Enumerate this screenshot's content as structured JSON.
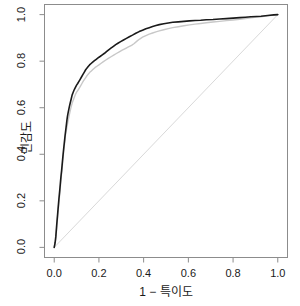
{
  "chart_data": {
    "type": "line",
    "title": "",
    "subtitle": "",
    "xlabel": "1 − 특이도",
    "ylabel": "민감도",
    "xlim": [
      0,
      1
    ],
    "ylim": [
      0,
      1
    ],
    "grid": false,
    "legend": "none",
    "xticks": [
      "0.0",
      "0.2",
      "0.4",
      "0.6",
      "0.8",
      "1.0"
    ],
    "xtick_values": [
      0.0,
      0.2,
      0.4,
      0.6,
      0.8,
      1.0
    ],
    "yticks": [
      "0.0",
      "0.2",
      "0.4",
      "0.6",
      "0.8",
      "1.0"
    ],
    "ytick_values": [
      0.0,
      0.2,
      0.4,
      0.6,
      0.8,
      1.0
    ],
    "series": [
      {
        "name": "roc-curve-black",
        "color": "#1a1a1a",
        "width": 1.6,
        "points": [
          [
            0.0,
            0.0
          ],
          [
            0.004,
            0.02
          ],
          [
            0.007,
            0.045
          ],
          [
            0.009,
            0.07
          ],
          [
            0.011,
            0.095
          ],
          [
            0.013,
            0.118
          ],
          [
            0.015,
            0.14
          ],
          [
            0.017,
            0.163
          ],
          [
            0.019,
            0.186
          ],
          [
            0.021,
            0.208
          ],
          [
            0.023,
            0.228
          ],
          [
            0.025,
            0.248
          ],
          [
            0.027,
            0.27
          ],
          [
            0.029,
            0.292
          ],
          [
            0.031,
            0.312
          ],
          [
            0.033,
            0.33
          ],
          [
            0.035,
            0.35
          ],
          [
            0.037,
            0.372
          ],
          [
            0.039,
            0.392
          ],
          [
            0.041,
            0.412
          ],
          [
            0.043,
            0.43
          ],
          [
            0.045,
            0.448
          ],
          [
            0.047,
            0.466
          ],
          [
            0.049,
            0.484
          ],
          [
            0.051,
            0.5
          ],
          [
            0.053,
            0.516
          ],
          [
            0.055,
            0.532
          ],
          [
            0.057,
            0.548
          ],
          [
            0.059,
            0.562
          ],
          [
            0.062,
            0.578
          ],
          [
            0.065,
            0.592
          ],
          [
            0.068,
            0.606
          ],
          [
            0.071,
            0.618
          ],
          [
            0.074,
            0.63
          ],
          [
            0.077,
            0.642
          ],
          [
            0.08,
            0.654
          ],
          [
            0.084,
            0.664
          ],
          [
            0.088,
            0.674
          ],
          [
            0.092,
            0.682
          ],
          [
            0.096,
            0.69
          ],
          [
            0.1,
            0.697
          ],
          [
            0.105,
            0.704
          ],
          [
            0.11,
            0.712
          ],
          [
            0.116,
            0.722
          ],
          [
            0.122,
            0.732
          ],
          [
            0.128,
            0.742
          ],
          [
            0.134,
            0.752
          ],
          [
            0.14,
            0.762
          ],
          [
            0.146,
            0.77
          ],
          [
            0.152,
            0.777
          ],
          [
            0.158,
            0.784
          ],
          [
            0.165,
            0.79
          ],
          [
            0.172,
            0.796
          ],
          [
            0.18,
            0.802
          ],
          [
            0.188,
            0.808
          ],
          [
            0.196,
            0.814
          ],
          [
            0.205,
            0.82
          ],
          [
            0.215,
            0.827
          ],
          [
            0.225,
            0.834
          ],
          [
            0.235,
            0.842
          ],
          [
            0.245,
            0.85
          ],
          [
            0.255,
            0.857
          ],
          [
            0.265,
            0.864
          ],
          [
            0.275,
            0.871
          ],
          [
            0.285,
            0.877
          ],
          [
            0.297,
            0.884
          ],
          [
            0.31,
            0.891
          ],
          [
            0.323,
            0.898
          ],
          [
            0.336,
            0.905
          ],
          [
            0.35,
            0.912
          ],
          [
            0.365,
            0.92
          ],
          [
            0.38,
            0.927
          ],
          [
            0.395,
            0.933
          ],
          [
            0.41,
            0.939
          ],
          [
            0.425,
            0.944
          ],
          [
            0.44,
            0.949
          ],
          [
            0.455,
            0.953
          ],
          [
            0.47,
            0.957
          ],
          [
            0.49,
            0.961
          ],
          [
            0.51,
            0.964
          ],
          [
            0.53,
            0.967
          ],
          [
            0.555,
            0.969
          ],
          [
            0.58,
            0.971
          ],
          [
            0.605,
            0.973
          ],
          [
            0.63,
            0.975
          ],
          [
            0.655,
            0.976
          ],
          [
            0.68,
            0.978
          ],
          [
            0.71,
            0.979
          ],
          [
            0.74,
            0.981
          ],
          [
            0.77,
            0.983
          ],
          [
            0.8,
            0.985
          ],
          [
            0.83,
            0.987
          ],
          [
            0.855,
            0.989
          ],
          [
            0.88,
            0.991
          ],
          [
            0.905,
            0.992
          ],
          [
            0.925,
            0.993
          ],
          [
            0.945,
            0.995
          ],
          [
            0.965,
            0.997
          ],
          [
            0.982,
            0.999
          ],
          [
            1.0,
            1.0
          ]
        ]
      },
      {
        "name": "roc-curve-gray",
        "color": "#c8c8c8",
        "width": 1.4,
        "points": [
          [
            0.0,
            0.0
          ],
          [
            0.005,
            0.022
          ],
          [
            0.008,
            0.046
          ],
          [
            0.01,
            0.07
          ],
          [
            0.012,
            0.094
          ],
          [
            0.014,
            0.116
          ],
          [
            0.016,
            0.138
          ],
          [
            0.018,
            0.16
          ],
          [
            0.02,
            0.182
          ],
          [
            0.022,
            0.204
          ],
          [
            0.024,
            0.224
          ],
          [
            0.026,
            0.244
          ],
          [
            0.028,
            0.266
          ],
          [
            0.03,
            0.288
          ],
          [
            0.032,
            0.308
          ],
          [
            0.034,
            0.326
          ],
          [
            0.036,
            0.346
          ],
          [
            0.038,
            0.368
          ],
          [
            0.04,
            0.388
          ],
          [
            0.042,
            0.408
          ],
          [
            0.044,
            0.426
          ],
          [
            0.046,
            0.444
          ],
          [
            0.048,
            0.462
          ],
          [
            0.05,
            0.48
          ],
          [
            0.053,
            0.496
          ],
          [
            0.056,
            0.512
          ],
          [
            0.059,
            0.528
          ],
          [
            0.062,
            0.543
          ],
          [
            0.065,
            0.557
          ],
          [
            0.068,
            0.571
          ],
          [
            0.071,
            0.584
          ],
          [
            0.074,
            0.597
          ],
          [
            0.077,
            0.608
          ],
          [
            0.08,
            0.619
          ],
          [
            0.084,
            0.63
          ],
          [
            0.088,
            0.64
          ],
          [
            0.092,
            0.65
          ],
          [
            0.096,
            0.659
          ],
          [
            0.1,
            0.667
          ],
          [
            0.106,
            0.675
          ],
          [
            0.112,
            0.684
          ],
          [
            0.118,
            0.694
          ],
          [
            0.124,
            0.704
          ],
          [
            0.13,
            0.714
          ],
          [
            0.137,
            0.724
          ],
          [
            0.144,
            0.734
          ],
          [
            0.151,
            0.743
          ],
          [
            0.158,
            0.751
          ],
          [
            0.166,
            0.758
          ],
          [
            0.174,
            0.765
          ],
          [
            0.182,
            0.772
          ],
          [
            0.191,
            0.778
          ],
          [
            0.2,
            0.784
          ],
          [
            0.21,
            0.791
          ],
          [
            0.22,
            0.798
          ],
          [
            0.231,
            0.805
          ],
          [
            0.242,
            0.812
          ],
          [
            0.254,
            0.819
          ],
          [
            0.266,
            0.826
          ],
          [
            0.278,
            0.833
          ],
          [
            0.291,
            0.84
          ],
          [
            0.304,
            0.847
          ],
          [
            0.318,
            0.854
          ],
          [
            0.332,
            0.861
          ],
          [
            0.346,
            0.868
          ],
          [
            0.358,
            0.876
          ],
          [
            0.37,
            0.886
          ],
          [
            0.382,
            0.895
          ],
          [
            0.395,
            0.903
          ],
          [
            0.41,
            0.91
          ],
          [
            0.425,
            0.916
          ],
          [
            0.44,
            0.921
          ],
          [
            0.455,
            0.926
          ],
          [
            0.47,
            0.93
          ],
          [
            0.49,
            0.935
          ],
          [
            0.51,
            0.94
          ],
          [
            0.53,
            0.944
          ],
          [
            0.555,
            0.948
          ],
          [
            0.58,
            0.952
          ],
          [
            0.605,
            0.956
          ],
          [
            0.63,
            0.959
          ],
          [
            0.655,
            0.962
          ],
          [
            0.68,
            0.965
          ],
          [
            0.71,
            0.968
          ],
          [
            0.74,
            0.971
          ],
          [
            0.77,
            0.974
          ],
          [
            0.8,
            0.977
          ],
          [
            0.83,
            0.98
          ],
          [
            0.855,
            0.983
          ],
          [
            0.88,
            0.986
          ],
          [
            0.905,
            0.989
          ],
          [
            0.925,
            0.991
          ],
          [
            0.945,
            0.994
          ],
          [
            0.965,
            0.996
          ],
          [
            0.982,
            0.998
          ],
          [
            1.0,
            1.0
          ]
        ]
      }
    ],
    "reference_line": {
      "name": "chance-diagonal",
      "color": "#d9d9d9",
      "width": 1.0,
      "from": [
        0.0,
        0.0
      ],
      "to": [
        1.0,
        1.0
      ]
    },
    "box_color": "#8c8c8c",
    "background": "#ffffff"
  }
}
